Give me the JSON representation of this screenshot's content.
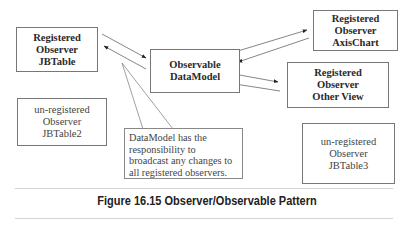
{
  "diagram": {
    "nodes": {
      "jbtable": {
        "lines": [
          "Registered",
          "Observer",
          "JBTable"
        ]
      },
      "datamodel": {
        "lines": [
          "Observable",
          "DataModel"
        ]
      },
      "axischart": {
        "lines": [
          "Registered",
          "Observer",
          "AxisChart"
        ]
      },
      "otherview": {
        "lines": [
          "Registered",
          "Observer",
          "Other View"
        ]
      },
      "jbtable2": {
        "lines": [
          "un-registered",
          "Observer",
          "JBTable2"
        ]
      },
      "jbtable3": {
        "lines": [
          "un-registered",
          "Observer",
          "JBTable3"
        ]
      }
    },
    "callout": {
      "lines": [
        "DataModel has the",
        "responsibility to",
        "broadcast any changes to",
        "all registered observers."
      ]
    },
    "edges": [
      {
        "from": "jbtable",
        "to": "datamodel",
        "bidirectional": true
      },
      {
        "from": "datamodel",
        "to": "axischart",
        "bidirectional": true
      },
      {
        "from": "datamodel",
        "to": "otherview",
        "bidirectional": true
      }
    ],
    "colors": {
      "border": "#777777",
      "text": "#333333",
      "rule": "#d4d4d4"
    }
  },
  "caption": "Figure 16.15 Observer/Observable Pattern"
}
